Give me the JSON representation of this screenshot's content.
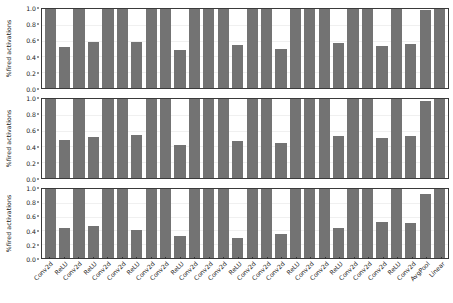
{
  "chart_data": {
    "type": "bar",
    "title": "",
    "xlabel": "",
    "ylabel": "%fired activations",
    "ylim": [
      0.0,
      1.0
    ],
    "yticks": [
      0.0,
      0.2,
      0.4,
      0.6,
      0.8,
      1.0
    ],
    "ytick_labels": [
      "0.0",
      "0.2",
      "0.4",
      "0.6",
      "0.8",
      "1.0"
    ],
    "grid": true,
    "legend": "none",
    "bar_color": "#737373",
    "panel_count": 3,
    "categories": [
      "Conv2d",
      "ReLU",
      "Conv2d",
      "ReLU",
      "Conv2d",
      "Conv2d",
      "ReLU",
      "Conv2d",
      "Conv2d",
      "ReLU",
      "Conv2d",
      "Conv2d",
      "Conv2d",
      "ReLU",
      "Conv2d",
      "Conv2d",
      "Conv2d",
      "ReLU",
      "Conv2d",
      "Conv2d",
      "ReLU",
      "Conv2d",
      "Conv2d",
      "Conv2d",
      "ReLU",
      "Conv2d",
      "AvgPool",
      "Linear"
    ],
    "panels": [
      {
        "name": "panel-top",
        "ylabel": "%fired activations",
        "values": [
          1.0,
          0.52,
          1.0,
          0.58,
          1.0,
          1.0,
          0.58,
          1.0,
          1.0,
          0.48,
          1.0,
          1.0,
          1.0,
          0.54,
          1.0,
          1.0,
          0.5,
          1.0,
          1.0,
          1.0,
          0.57,
          1.0,
          1.0,
          0.53,
          1.0,
          0.56,
          0.99,
          1.0
        ]
      },
      {
        "name": "panel-middle",
        "ylabel": "%fired activations",
        "values": [
          1.0,
          0.48,
          1.0,
          0.52,
          1.0,
          1.0,
          0.54,
          1.0,
          1.0,
          0.42,
          1.0,
          1.0,
          1.0,
          0.47,
          1.0,
          1.0,
          0.44,
          1.0,
          1.0,
          1.0,
          0.53,
          1.0,
          1.0,
          0.51,
          1.0,
          0.53,
          0.98,
          1.0
        ]
      },
      {
        "name": "panel-bottom",
        "ylabel": "%fired activations",
        "values": [
          1.0,
          0.43,
          1.0,
          0.46,
          1.0,
          1.0,
          0.4,
          1.0,
          1.0,
          0.32,
          1.0,
          1.0,
          1.0,
          0.29,
          1.0,
          1.0,
          0.35,
          1.0,
          1.0,
          1.0,
          0.43,
          1.0,
          1.0,
          0.52,
          1.0,
          0.51,
          0.93,
          1.0
        ]
      }
    ]
  }
}
